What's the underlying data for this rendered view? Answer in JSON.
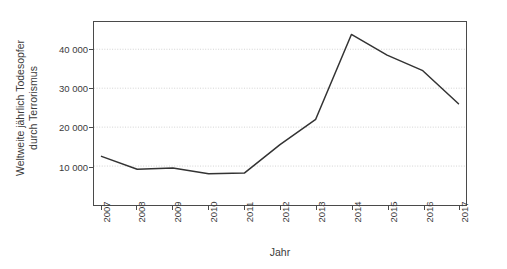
{
  "chart_data": {
    "type": "line",
    "title": "",
    "xlabel": "Jahr",
    "ylabel_line1": "Weltweite jährlich Todesopfer",
    "ylabel_line2": "durch Terrorismus",
    "categories": [
      "2007",
      "2008",
      "2009",
      "2010",
      "2011",
      "2012",
      "2013",
      "2014",
      "2015",
      "2016",
      "2017"
    ],
    "values": [
      12500,
      9200,
      9500,
      8000,
      8200,
      15500,
      22000,
      43800,
      38500,
      34500,
      26000
    ],
    "series": [
      {
        "name": "Weltweite jährlich Todesopfer durch Terrorismus",
        "values": [
          12500,
          9200,
          9500,
          8000,
          8200,
          15500,
          22000,
          43800,
          38500,
          34500,
          26000
        ]
      }
    ],
    "ylim": [
      0,
      47000
    ],
    "xlim": [
      "2007",
      "2017"
    ],
    "yticks": [
      10000,
      20000,
      30000,
      40000
    ],
    "ytick_labels": [
      "10 000",
      "20 000",
      "30 000",
      "40 000"
    ],
    "grid": "horizontal-dotted",
    "legend": "none",
    "line_color": "#333333",
    "grid_color": "#c8c8c8",
    "axis_color": "#4a4a4a"
  }
}
